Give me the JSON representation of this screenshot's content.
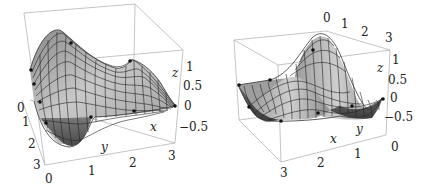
{
  "figure": {
    "panels": [
      {
        "id": "left",
        "axes": {
          "x_label": "x",
          "y_label": "y",
          "z_label": "z",
          "x_ticks": [
            "0",
            "1",
            "2",
            "3"
          ],
          "y_ticks": [
            "0",
            "1",
            "2",
            "3"
          ],
          "z_ticks": [
            "1",
            "0.5",
            "0",
            "−0.5"
          ]
        }
      },
      {
        "id": "right",
        "axes": {
          "x_label": "x",
          "y_label": "y",
          "z_label": "z",
          "x_ticks": [
            "3",
            "2",
            "1",
            "0"
          ],
          "y_ticks": [
            "0",
            "1",
            "2",
            "3"
          ],
          "z_ticks": [
            "1",
            "0.5",
            "0",
            "−0.5"
          ]
        }
      }
    ]
  },
  "colors": {
    "surface_light": "#c8c8c8",
    "surface_dark": "#555555",
    "mesh": "#222222",
    "box": "#b5b5b5",
    "points": "#111111"
  }
}
